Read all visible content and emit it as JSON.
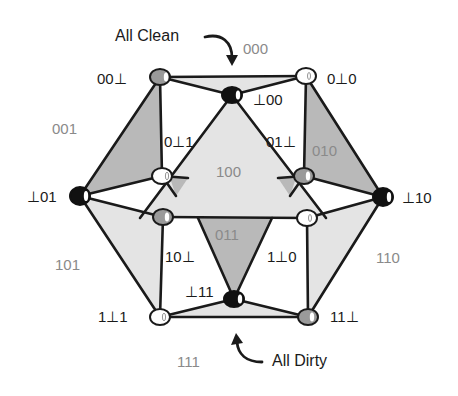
{
  "callouts": {
    "all_clean": "All Clean",
    "all_dirty": "All Dirty"
  },
  "faces": {
    "f000": "000",
    "f001": "001",
    "f010": "010",
    "f100": "100",
    "f011": "011",
    "f101": "101",
    "f110": "110",
    "f111": "111"
  },
  "vertices": {
    "v00b": "00⊥",
    "v0b0": "0⊥0",
    "vb00": "⊥00",
    "v0b1": "0⊥1",
    "v01b": "01⊥",
    "vb01": "⊥01",
    "vb10": "⊥10",
    "v10b": "10⊥",
    "v1b0": "1⊥0",
    "vb11": "⊥11",
    "v1b1": "1⊥1",
    "v11b": "11⊥"
  },
  "colors": {
    "face_dark": "#b9b9b9",
    "face_light": "#e4e4e4",
    "node_black": "#111111",
    "node_gray": "#9a9a9a",
    "node_white": "#ffffff",
    "stroke": "#1a1a1a"
  }
}
